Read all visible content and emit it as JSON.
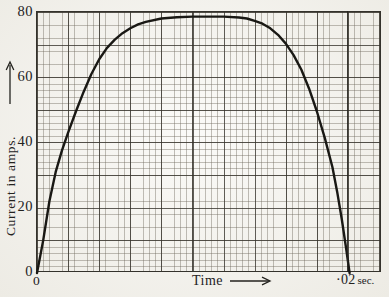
{
  "figure": {
    "paper_color": "#f6f5f0",
    "ink_color": "#23221e",
    "curve_color": "#191814",
    "grid": {
      "fine_color": "#6e685c",
      "major_color": "#34312a",
      "border_color": "#34322c",
      "amps_per_fine_square": 2,
      "amps_per_major_square": 10,
      "seconds_per_fine_square": 0.0004,
      "seconds_per_major_square": 0.002
    },
    "y_axis": {
      "label": "Current in amps.",
      "arrow_icon": "up-arrow",
      "ticks": [
        {
          "label": "80",
          "value": 80
        },
        {
          "label": "60",
          "value": 60
        },
        {
          "label": "40",
          "value": 40
        },
        {
          "label": "20",
          "value": 20
        },
        {
          "label": "0",
          "value": 0
        }
      ]
    },
    "x_axis": {
      "label": "Time",
      "arrow_icon": "right-arrow",
      "origin_label": "0",
      "end_value_label": "·02",
      "end_unit_label": "sec."
    }
  },
  "chart_data": {
    "type": "line",
    "title": "",
    "xlabel": "Time",
    "ylabel": "Current in amps.",
    "x_unit": "sec",
    "y_unit": "amps",
    "xlim": [
      0,
      0.0222
    ],
    "ylim": [
      0,
      80
    ],
    "x_end_marker": 0.02,
    "grid": "fine graph paper: minor 2 amps / 0.0004 sec, major 10 amps / 0.002 sec",
    "legend": "none",
    "series": [
      {
        "name": "Current",
        "color": "#191814",
        "points": [
          [
            0.0,
            0.0
          ],
          [
            0.0004,
            10.0
          ],
          [
            0.0008,
            22.0
          ],
          [
            0.0012,
            31.0
          ],
          [
            0.0016,
            37.5
          ],
          [
            0.002,
            43.0
          ],
          [
            0.0025,
            49.5
          ],
          [
            0.003,
            55.5
          ],
          [
            0.0035,
            61.0
          ],
          [
            0.004,
            65.5
          ],
          [
            0.0045,
            69.0
          ],
          [
            0.005,
            71.5
          ],
          [
            0.0055,
            73.5
          ],
          [
            0.006,
            75.0
          ],
          [
            0.0065,
            76.2
          ],
          [
            0.007,
            77.0
          ],
          [
            0.008,
            78.0
          ],
          [
            0.009,
            78.4
          ],
          [
            0.01,
            78.6
          ],
          [
            0.011,
            78.6
          ],
          [
            0.012,
            78.6
          ],
          [
            0.013,
            78.3
          ],
          [
            0.0135,
            78.0
          ],
          [
            0.014,
            77.3
          ],
          [
            0.0145,
            76.4
          ],
          [
            0.015,
            75.0
          ],
          [
            0.0155,
            73.0
          ],
          [
            0.016,
            70.3
          ],
          [
            0.0165,
            66.8
          ],
          [
            0.017,
            62.3
          ],
          [
            0.0175,
            56.5
          ],
          [
            0.018,
            49.5
          ],
          [
            0.0185,
            41.5
          ],
          [
            0.019,
            32.5
          ],
          [
            0.0193,
            25.0
          ],
          [
            0.0196,
            16.5
          ],
          [
            0.0199,
            7.0
          ],
          [
            0.0201,
            0.0
          ]
        ]
      }
    ]
  }
}
